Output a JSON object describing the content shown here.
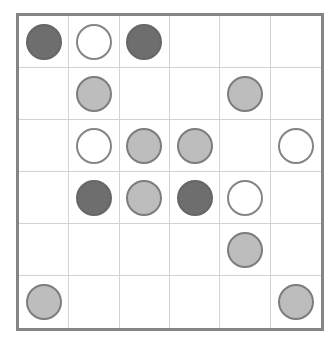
{
  "board": {
    "rows": 6,
    "cols": 6,
    "legend": {
      "D": "dark",
      "L": "light",
      "W": "white",
      ".": "empty"
    },
    "colors": {
      "dark": "#6e6e6e",
      "light": "#bdbdbd",
      "white": "#ffffff",
      "stone_border": "#7d7d7d",
      "grid_line": "#d2d2d2",
      "frame": "#858585"
    },
    "cells": [
      [
        "D",
        "W",
        "D",
        ".",
        ".",
        "."
      ],
      [
        ".",
        "L",
        ".",
        ".",
        "L",
        "."
      ],
      [
        ".",
        "W",
        "L",
        "L",
        ".",
        "W"
      ],
      [
        ".",
        "D",
        "L",
        "D",
        "W",
        "."
      ],
      [
        ".",
        ".",
        ".",
        ".",
        "L",
        "."
      ],
      [
        "L",
        ".",
        ".",
        ".",
        ".",
        "L"
      ]
    ]
  }
}
